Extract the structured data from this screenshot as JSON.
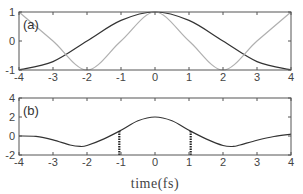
{
  "chart_data": [
    {
      "type": "line",
      "panel_label": "(a)",
      "title": "",
      "xlabel": "",
      "ylabel": "",
      "xlim": [
        -4,
        4
      ],
      "ylim": [
        -1,
        1
      ],
      "xticks": [
        -4,
        -3,
        -2,
        -1,
        0,
        1,
        2,
        3,
        4
      ],
      "yticks": [
        -1,
        0,
        1
      ],
      "grid": false,
      "series": [
        {
          "name": "dark curve",
          "color": "#333333",
          "x": [
            -4,
            -3,
            -2,
            -1,
            0,
            1,
            2,
            3,
            4
          ],
          "y": [
            -1.0,
            -0.71,
            0.0,
            0.71,
            1.0,
            0.71,
            0.0,
            -0.71,
            -1.0
          ]
        },
        {
          "name": "light curve",
          "color": "#b0b0b0",
          "x": [
            -4,
            -3,
            -2,
            -1,
            0,
            1,
            2,
            3,
            4
          ],
          "y": [
            1.0,
            0.0,
            -1.0,
            0.0,
            1.0,
            0.0,
            -1.0,
            0.0,
            1.0
          ]
        }
      ]
    },
    {
      "type": "line",
      "panel_label": "(b)",
      "title": "",
      "xlabel": "time(fs)",
      "ylabel": "",
      "xlim": [
        -4,
        4
      ],
      "ylim": [
        -2,
        4
      ],
      "xticks": [
        -4,
        -3,
        -2,
        -1,
        0,
        1,
        2,
        3,
        4
      ],
      "yticks": [
        -2,
        0,
        2,
        4
      ],
      "grid": false,
      "series": [
        {
          "name": "signal",
          "color": "#333333",
          "x": [
            -4,
            -3.5,
            -3,
            -2.5,
            -2.2,
            -2,
            -1.5,
            -1,
            -0.5,
            0,
            0.5,
            1,
            1.5,
            2,
            2.3,
            2.5,
            3,
            3.5,
            4
          ],
          "y": [
            0.0,
            -0.05,
            -0.4,
            -0.95,
            -1.1,
            -1.0,
            -0.3,
            0.6,
            1.6,
            2.0,
            1.6,
            0.6,
            -0.3,
            -1.0,
            -1.1,
            -0.95,
            -0.45,
            -0.05,
            0.2
          ]
        }
      ],
      "annotations": [
        {
          "type": "dotted-vline",
          "x": -1.05,
          "y_from": -2,
          "y_to": 0.6
        },
        {
          "type": "dotted-vline",
          "x": 1.05,
          "y_from": -2,
          "y_to": 0.6
        }
      ]
    }
  ]
}
